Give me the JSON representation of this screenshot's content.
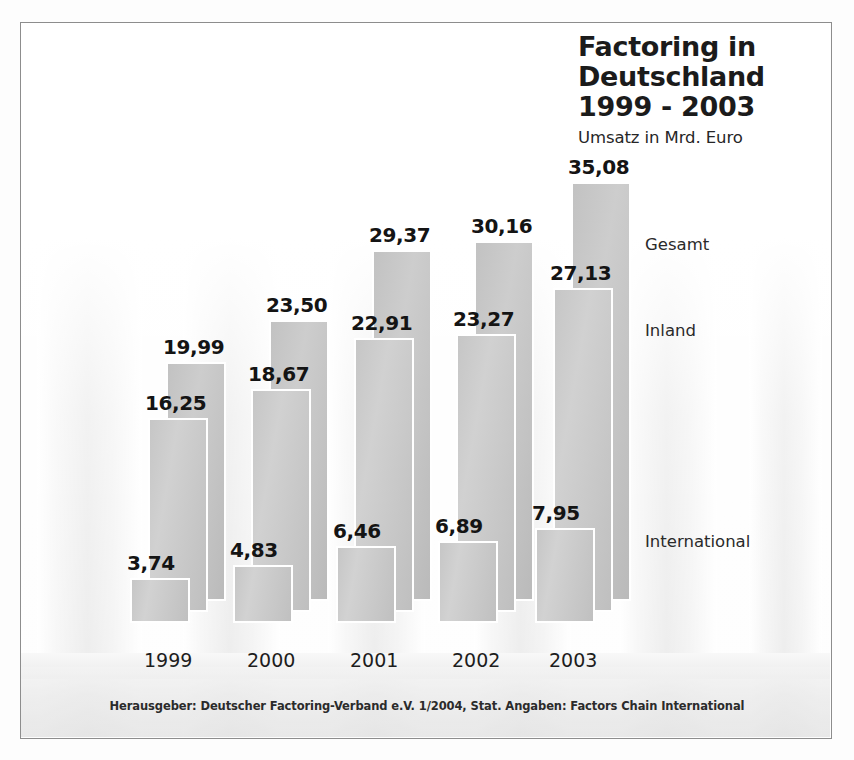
{
  "title": {
    "line1": "Factoring in",
    "line2": "Deutschland",
    "line3": "1999 - 2003",
    "subtitle": "Umsatz in Mrd. Euro"
  },
  "legend": {
    "gesamt": "Gesamt",
    "inland": "Inland",
    "international": "International"
  },
  "footer": {
    "text": "Herausgeber: Deutscher Factoring-Verband e.V. 1/2004, Stat. Angaben: Factors Chain International"
  },
  "colors": {
    "bar_fill": "#c9c9c9",
    "bar_edge": "#ffffff",
    "text": "#1b1b1b",
    "frame": "#8d8d8d",
    "background": "#fdfdfd"
  },
  "chart_data": {
    "type": "bar",
    "title": "Factoring in Deutschland 1999 - 2003",
    "subtitle": "Umsatz in Mrd. Euro",
    "xlabel": "",
    "ylabel": "Umsatz in Mrd. Euro",
    "ylim": [
      0,
      35.08
    ],
    "grid": false,
    "legend_position": "right",
    "value_format": "german-decimal-comma",
    "categories": [
      "1999",
      "2000",
      "2001",
      "2002",
      "2003"
    ],
    "series": [
      {
        "name": "International",
        "values": [
          3.74,
          4.83,
          6.46,
          6.89,
          7.95
        ],
        "labels": [
          "3,74",
          "4,83",
          "6,46",
          "6,89",
          "7,95"
        ]
      },
      {
        "name": "Inland",
        "values": [
          16.25,
          18.67,
          22.91,
          23.27,
          27.13
        ],
        "labels": [
          "16,25",
          "18,67",
          "22,91",
          "23,27",
          "27,13"
        ]
      },
      {
        "name": "Gesamt",
        "values": [
          19.99,
          23.5,
          29.37,
          30.16,
          35.08
        ],
        "labels": [
          "19,99",
          "23,50",
          "29,37",
          "30,16",
          "35,08"
        ]
      }
    ],
    "annotations": [
      "Herausgeber: Deutscher Factoring-Verband e.V. 1/2004, Stat. Angaben: Factors Chain International"
    ]
  }
}
